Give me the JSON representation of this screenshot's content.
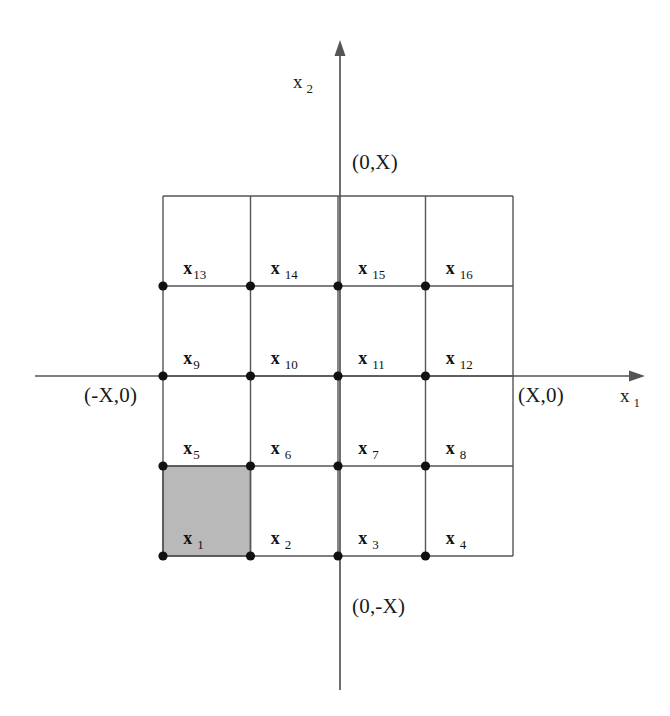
{
  "figure": {
    "background_color": "#ffffff",
    "width": 670,
    "height": 716
  },
  "axes": {
    "line_color": "#555555",
    "horizontal": {
      "name": "x",
      "subscript": "1",
      "label_full": "x 1",
      "y": 376,
      "x_start": 35,
      "x_end": 645,
      "arrow": "right"
    },
    "vertical": {
      "name": "x",
      "subscript": "2",
      "label_full": "x 2",
      "x": 340,
      "y_start": 690,
      "y_end": 40,
      "arrow": "up"
    },
    "annotations": [
      {
        "id": "top",
        "text": "(0,X)",
        "x": 352,
        "y": 152
      },
      {
        "id": "right",
        "text": "(X,0)",
        "x": 518,
        "y": 385
      },
      {
        "id": "left",
        "text": "(-X,0)",
        "x": 84,
        "y": 385
      },
      {
        "id": "bottom",
        "text": "(0,-X)",
        "x": 352,
        "y": 596
      }
    ]
  },
  "grid": {
    "left": 163,
    "top": 196,
    "right": 513,
    "bottom": 556,
    "columns": 4,
    "rows": 4,
    "cell_width": 87.5,
    "cell_height": 90,
    "line_color": "#555555",
    "line_width": 1.4,
    "border_color": "#444444"
  },
  "nodes": {
    "marker": "filled-circle",
    "radius": 4.6,
    "color": "#111111",
    "x_positions": [
      163,
      250.5,
      338,
      425.5
    ],
    "y_positions": [
      286,
      376,
      466,
      556
    ],
    "count": 16
  },
  "elements": {
    "symbol": "x",
    "shaded_element": "1",
    "shade_color": "#b9b9b9",
    "shade_border": "#4a4a4a",
    "items": [
      {
        "label": "1",
        "sub": "1",
        "col": 0,
        "row": 0,
        "gap": true,
        "shaded": true
      },
      {
        "label": "2",
        "sub": "2",
        "col": 1,
        "row": 0,
        "gap": true,
        "shaded": false
      },
      {
        "label": "3",
        "sub": "3",
        "col": 2,
        "row": 0,
        "gap": true,
        "shaded": false
      },
      {
        "label": "4",
        "sub": "4",
        "col": 3,
        "row": 0,
        "gap": true,
        "shaded": false
      },
      {
        "label": "5",
        "sub": "5",
        "col": 0,
        "row": 1,
        "gap": false,
        "shaded": false
      },
      {
        "label": "6",
        "sub": "6",
        "col": 1,
        "row": 1,
        "gap": true,
        "shaded": false
      },
      {
        "label": "7",
        "sub": "7",
        "col": 2,
        "row": 1,
        "gap": true,
        "shaded": false
      },
      {
        "label": "8",
        "sub": "8",
        "col": 3,
        "row": 1,
        "gap": true,
        "shaded": false
      },
      {
        "label": "9",
        "sub": "9",
        "col": 0,
        "row": 2,
        "gap": false,
        "shaded": false
      },
      {
        "label": "10",
        "sub": "10",
        "col": 1,
        "row": 2,
        "gap": true,
        "shaded": false
      },
      {
        "label": "11",
        "sub": "11",
        "col": 2,
        "row": 2,
        "gap": true,
        "shaded": false
      },
      {
        "label": "12",
        "sub": "12",
        "col": 3,
        "row": 2,
        "gap": true,
        "shaded": false
      },
      {
        "label": "13",
        "sub": "13",
        "col": 0,
        "row": 3,
        "gap": false,
        "shaded": false
      },
      {
        "label": "14",
        "sub": "14",
        "col": 1,
        "row": 3,
        "gap": true,
        "shaded": false
      },
      {
        "label": "15",
        "sub": "15",
        "col": 2,
        "row": 3,
        "gap": true,
        "shaded": false
      },
      {
        "label": "16",
        "sub": "16",
        "col": 3,
        "row": 3,
        "gap": true,
        "shaded": false
      }
    ]
  }
}
